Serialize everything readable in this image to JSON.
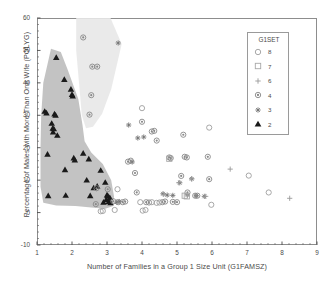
{
  "chart_data": {
    "type": "scatter",
    "title": "",
    "xlabel": "Number of Families in a Group 1 Size Unit (G1FAMSZ)",
    "ylabel": "Percentage of Males with More Than One Wife (POLYG)",
    "xlim": [
      1,
      9
    ],
    "ylim": [
      -10,
      60
    ],
    "xticks": [
      1,
      2,
      3,
      4,
      5,
      6,
      7,
      8,
      9
    ],
    "yticks": [
      -10,
      0,
      10,
      20,
      30,
      40,
      50,
      60
    ],
    "minor_tick_divisions": 5,
    "grid": false,
    "legend": {
      "title": "G1SET",
      "position": "top-right-inside",
      "entries": [
        {
          "label": "8",
          "marker": "open-circle"
        },
        {
          "label": "7",
          "marker": "open-square"
        },
        {
          "label": "6",
          "marker": "plus"
        },
        {
          "label": "4",
          "marker": "circle-dot"
        },
        {
          "label": "3",
          "marker": "asterisk"
        },
        {
          "label": "2",
          "marker": "filled-triangle"
        }
      ]
    },
    "annotations": [
      {
        "name": "dark-cluster-region",
        "kind": "shaded-polygon",
        "color": "#b8b8b8",
        "opacity": 0.85,
        "description": "Dark gray highlighted region enclosing the G1SET=2 filled-triangle cluster at low family size"
      },
      {
        "name": "light-cluster-region",
        "kind": "shaded-polygon",
        "color": "#e8e8e8",
        "opacity": 0.9,
        "description": "Light gray highlighted region enclosing the high-polygyny circle-dot cluster"
      }
    ],
    "series": [
      {
        "name": "2",
        "marker": "filled-triangle",
        "color": "#1a1a1a",
        "points": [
          [
            1.22,
            31.2
          ],
          [
            1.27,
            30.7
          ],
          [
            1.3,
            18.0
          ],
          [
            1.32,
            5.2
          ],
          [
            1.42,
            27.5
          ],
          [
            1.45,
            26.0
          ],
          [
            1.46,
            24.8
          ],
          [
            1.48,
            25.8
          ],
          [
            1.5,
            30.4
          ],
          [
            1.53,
            30.0
          ],
          [
            1.55,
            47.8
          ],
          [
            1.58,
            23.8
          ],
          [
            1.78,
            41.0
          ],
          [
            1.8,
            13.2
          ],
          [
            1.82,
            5.3
          ],
          [
            1.97,
            38.0
          ],
          [
            2.0,
            36.4
          ],
          [
            2.02,
            35.9
          ],
          [
            2.05,
            16.8
          ],
          [
            2.08,
            16.2
          ],
          [
            2.32,
            18.3
          ],
          [
            2.42,
            10.0
          ],
          [
            2.48,
            16.5
          ],
          [
            2.52,
            5.2
          ],
          [
            2.62,
            7.6
          ],
          [
            2.72,
            8.1
          ],
          [
            2.82,
            13.0
          ],
          [
            2.9,
            3.2
          ],
          [
            2.95,
            9.3
          ],
          [
            2.98,
            4.0
          ],
          [
            3.0,
            5.4
          ],
          [
            3.02,
            5.2
          ],
          [
            3.05,
            3.4
          ],
          [
            3.08,
            4.6
          ],
          [
            3.1,
            3.0
          ]
        ]
      },
      {
        "name": "3",
        "marker": "asterisk",
        "color": "#707070",
        "points": [
          [
            3.32,
            52.3
          ],
          [
            3.62,
            27.0
          ],
          [
            3.88,
            23.0
          ],
          [
            4.05,
            23.3
          ],
          [
            3.72,
            15.6
          ],
          [
            4.6,
            5.8
          ],
          [
            4.72,
            5.4
          ],
          [
            4.88,
            5.3
          ],
          [
            5.08,
            9.2
          ],
          [
            5.3,
            5.4
          ],
          [
            5.42,
            10.4
          ],
          [
            5.55,
            5.2
          ],
          [
            5.78,
            5.0
          ],
          [
            3.28,
            3.2
          ],
          [
            3.35,
            3.4
          ]
        ]
      },
      {
        "name": "4",
        "marker": "circle-dot",
        "color": "#888888",
        "points": [
          [
            2.32,
            54.0
          ],
          [
            2.58,
            45.0
          ],
          [
            2.72,
            45.0
          ],
          [
            2.55,
            36.2
          ],
          [
            2.5,
            30.2
          ],
          [
            2.7,
            7.5
          ],
          [
            2.68,
            2.6
          ],
          [
            3.02,
            7.2
          ],
          [
            3.18,
            3.5
          ],
          [
            3.32,
            3.2
          ],
          [
            3.6,
            15.7
          ],
          [
            3.68,
            16.0
          ],
          [
            3.8,
            12.2
          ],
          [
            3.85,
            6.2
          ],
          [
            4.0,
            28.0
          ],
          [
            4.28,
            25.0
          ],
          [
            4.35,
            25.2
          ],
          [
            4.42,
            22.2
          ],
          [
            4.58,
            3.2
          ],
          [
            4.66,
            3.4
          ],
          [
            4.78,
            17.0
          ],
          [
            4.82,
            16.8
          ],
          [
            4.88,
            3.3
          ],
          [
            5.0,
            3.2
          ],
          [
            5.12,
            11.3
          ],
          [
            5.18,
            24.0
          ],
          [
            5.22,
            17.2
          ],
          [
            5.28,
            17.0
          ],
          [
            5.3,
            6.2
          ],
          [
            5.52,
            5.2
          ],
          [
            5.58,
            5.2
          ],
          [
            5.88,
            17.2
          ],
          [
            5.92,
            10.3
          ],
          [
            3.45,
            3.2
          ],
          [
            3.52,
            3.4
          ],
          [
            4.12,
            3.2
          ],
          [
            4.2,
            3.1
          ]
        ]
      },
      {
        "name": "6",
        "marker": "plus",
        "color": "#9a9a9a",
        "points": [
          [
            5.42,
            10.4
          ],
          [
            5.82,
            5.0
          ],
          [
            6.52,
            13.4
          ],
          [
            8.22,
            4.4
          ],
          [
            4.62,
            5.6
          ],
          [
            5.05,
            9.2
          ]
        ]
      },
      {
        "name": "7",
        "marker": "open-square",
        "color": "#a8a8a8",
        "points": [
          [
            4.78,
            16.6
          ],
          [
            5.22,
            5.2
          ],
          [
            5.28,
            5.0
          ]
        ]
      },
      {
        "name": "8",
        "marker": "open-circle",
        "color": "#9e9e9e",
        "points": [
          [
            4.0,
            32.2
          ],
          [
            5.92,
            26.2
          ],
          [
            7.05,
            11.4
          ],
          [
            7.62,
            6.2
          ],
          [
            5.98,
            2.4
          ],
          [
            3.3,
            7.2
          ],
          [
            3.22,
            0.8
          ],
          [
            2.82,
            0.4
          ],
          [
            2.88,
            0.5
          ],
          [
            4.02,
            0.6
          ],
          [
            4.1,
            0.8
          ],
          [
            4.42,
            3.0
          ],
          [
            4.5,
            3.1
          ],
          [
            3.95,
            3.2
          ],
          [
            4.28,
            3.2
          ]
        ]
      }
    ]
  }
}
